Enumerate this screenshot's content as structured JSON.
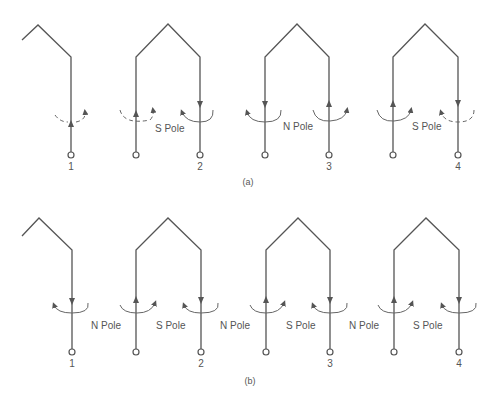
{
  "diagram": {
    "panel_a": {
      "caption": "(a)",
      "terminal_numbers": [
        "1",
        "2",
        "3",
        "4"
      ],
      "pole_labels": [
        "S Pole",
        "N Pole",
        "S Pole"
      ]
    },
    "panel_b": {
      "caption": "(b)",
      "terminal_numbers": [
        "1",
        "2",
        "3",
        "4"
      ],
      "pole_labels": [
        "N Pole",
        "S Pole",
        "N Pole",
        "S Pole",
        "N Pole",
        "S Pole"
      ]
    },
    "colors": {
      "line": "#555555",
      "background": "#ffffff"
    }
  }
}
